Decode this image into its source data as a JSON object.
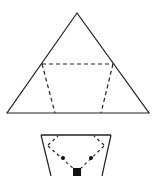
{
  "caption": "",
  "diagram": {
    "triangle": {
      "apex": [
        77,
        13
      ],
      "base_left": [
        7,
        113
      ],
      "base_right": [
        149,
        113
      ],
      "stroke": "#222222"
    },
    "fold_lines": {
      "top_left": [
        42,
        64
      ],
      "top_right": [
        113,
        64
      ],
      "bottom_left": [
        55,
        113
      ],
      "bottom_right": [
        101,
        113
      ]
    },
    "folded_shape": {
      "top_left": [
        41,
        135
      ],
      "top_right": [
        111,
        135
      ],
      "bottom_left": [
        51,
        176
      ],
      "bottom_right": [
        102,
        176
      ],
      "dots": [
        [
          63,
          158
        ],
        [
          91,
          158
        ]
      ],
      "square_center": [
        77,
        172
      ]
    }
  }
}
